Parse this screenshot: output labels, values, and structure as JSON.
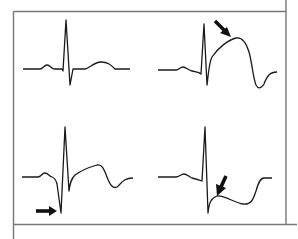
{
  "figure": {
    "colors": {
      "frame": "#666666",
      "trace": "#1a1a1a",
      "arrow": "#111111",
      "background": "#ffffff"
    },
    "panels": [
      {
        "id": "normal",
        "position": "top-left",
        "label": "Normal ECG complex",
        "has_arrow": false
      },
      {
        "id": "st-elevation",
        "position": "top-right",
        "label": "ST elevation (arrow pointing at elevated ST segment)",
        "has_arrow": true,
        "arrow_direction": "down-right"
      },
      {
        "id": "pathologic-q",
        "position": "bottom-left",
        "label": "Pathologic Q wave (arrow pointing at deep Q wave)",
        "has_arrow": true,
        "arrow_direction": "right"
      },
      {
        "id": "st-depression",
        "position": "bottom-right",
        "label": "ST depression (arrow pointing at depressed ST segment)",
        "has_arrow": true,
        "arrow_direction": "down-left"
      }
    ]
  }
}
